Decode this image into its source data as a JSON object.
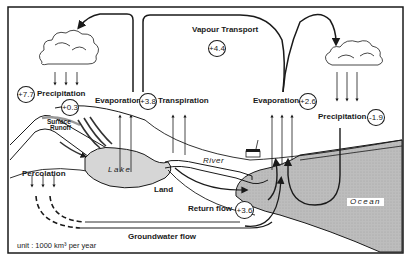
{
  "diagram": {
    "unit_label": "unit : 1000 km³ per year",
    "labels": {
      "precipitation_land": "Precipitation",
      "precipitation_ocean": "Precipitation",
      "evaporation_land": "Evaporation",
      "transpiration": "Transpiration",
      "evaporation_ocean": "Evaporation",
      "vapour_transport": "Vapour Transport",
      "surface_runoff_1": "Surface",
      "surface_runoff_2": "Runoff",
      "lake": "Lake",
      "river": "River",
      "land": "Land",
      "ocean": "Ocean",
      "percolation": "Percolation",
      "return_flow": "Return flow",
      "groundwater_flow": "Groundwater flow"
    },
    "values": {
      "precipitation_land": "+7.7",
      "surface_runoff": "+0.3",
      "evapotranspiration_land": "+3.8",
      "vapour_transport": "+4.4",
      "evaporation_ocean": "+2.6",
      "precipitation_ocean": "-1.9",
      "return_flow": "+3.6"
    },
    "colors": {
      "ink": "#1a1a1a",
      "ocean_fill": "#b8b8b8",
      "lake_fill": "#d4d4d4",
      "background": "#ffffff"
    }
  }
}
